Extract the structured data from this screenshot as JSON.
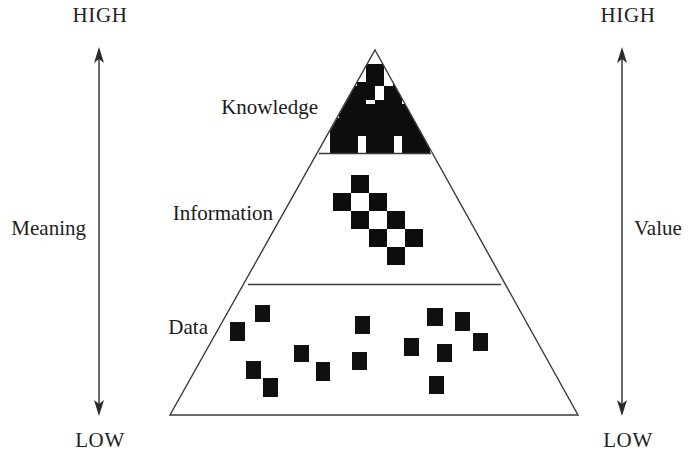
{
  "diagram": {
    "name": "dikw-pyramid",
    "background_color": "#ffffff",
    "ink_color": "#1a1a1a"
  },
  "left_axis": {
    "name": "Meaning",
    "top_cap": "HIGH",
    "bottom_cap": "LOW",
    "label": "Meaning",
    "direction": "double-headed-vertical",
    "x": 99,
    "top_y": 48,
    "bottom_y": 415
  },
  "right_axis": {
    "name": "Value",
    "top_cap": "HIGH",
    "bottom_cap": "LOW",
    "label": "Value",
    "direction": "double-headed-vertical",
    "x": 622,
    "top_y": 48,
    "bottom_y": 415
  },
  "pyramid": {
    "apex": {
      "x": 375,
      "y": 50
    },
    "base_left": {
      "x": 170,
      "y": 415
    },
    "base_right": {
      "x": 578,
      "y": 415
    },
    "tiers": [
      {
        "id": "knowledge",
        "label": "Knowledge",
        "label_x": 265,
        "label_y": 107,
        "fill_pattern": "dense-checkerboard",
        "divider_y": 153,
        "divider_x1": 322,
        "divider_x2": 430
      },
      {
        "id": "information",
        "label": "Information",
        "label_x": 205,
        "label_y": 213,
        "fill_pattern": "diagonal-checkerboard",
        "divider_y": 284,
        "divider_x1": 248,
        "divider_x2": 501
      },
      {
        "id": "data",
        "label": "Data",
        "label_x": 178,
        "label_y": 328,
        "fill_pattern": "scattered-squares",
        "divider_y": 415,
        "divider_x1": 170,
        "divider_x2": 578
      }
    ]
  },
  "chart_data": {
    "type": "diagram",
    "checker_cell": 18,
    "knowledge_checker_rows": [
      {
        "row": 0,
        "y": 50,
        "cells": []
      },
      {
        "row": 1,
        "y": 68,
        "cells": [
          {
            "x": 366,
            "dark": true
          }
        ]
      },
      {
        "row": 2,
        "y": 86,
        "cells": [
          {
            "x": 348,
            "dark": true
          },
          {
            "x": 366,
            "dark": false
          },
          {
            "x": 384,
            "dark": true
          }
        ]
      },
      {
        "row": 3,
        "y": 104,
        "cells": [
          {
            "x": 339,
            "dark": false
          },
          {
            "x": 357,
            "dark": true
          },
          {
            "x": 375,
            "dark": false
          },
          {
            "x": 393,
            "dark": true
          },
          {
            "x": 411,
            "dark": false
          }
        ]
      },
      {
        "row": 4,
        "y": 118,
        "cells": [
          {
            "x": 330,
            "dark": true
          },
          {
            "x": 348,
            "dark": false
          },
          {
            "x": 366,
            "dark": true
          },
          {
            "x": 384,
            "dark": false
          },
          {
            "x": 402,
            "dark": true
          },
          {
            "x": 420,
            "dark": false
          }
        ]
      },
      {
        "row": 5,
        "y": 136,
        "cells": [
          {
            "x": 322,
            "dark": false
          },
          {
            "x": 340,
            "dark": true
          },
          {
            "x": 358,
            "dark": false
          },
          {
            "x": 376,
            "dark": true
          },
          {
            "x": 394,
            "dark": false
          },
          {
            "x": 412,
            "dark": true
          }
        ]
      }
    ],
    "information_cells": [
      {
        "x": 351,
        "y": 175,
        "dark": true
      },
      {
        "x": 333,
        "y": 193,
        "dark": true
      },
      {
        "x": 351,
        "y": 193,
        "dark": false
      },
      {
        "x": 369,
        "y": 193,
        "dark": true
      },
      {
        "x": 351,
        "y": 211,
        "dark": true
      },
      {
        "x": 369,
        "y": 211,
        "dark": false
      },
      {
        "x": 387,
        "y": 211,
        "dark": true
      },
      {
        "x": 369,
        "y": 229,
        "dark": true
      },
      {
        "x": 387,
        "y": 229,
        "dark": false
      },
      {
        "x": 405,
        "y": 229,
        "dark": true
      },
      {
        "x": 387,
        "y": 247,
        "dark": true
      }
    ],
    "data_squares": [
      {
        "x": 255,
        "y": 305,
        "w": 15,
        "h": 17
      },
      {
        "x": 230,
        "y": 322,
        "w": 15,
        "h": 19
      },
      {
        "x": 294,
        "y": 345,
        "w": 15,
        "h": 17
      },
      {
        "x": 316,
        "y": 362,
        "w": 14,
        "h": 19
      },
      {
        "x": 246,
        "y": 361,
        "w": 15,
        "h": 18
      },
      {
        "x": 263,
        "y": 378,
        "w": 15,
        "h": 19
      },
      {
        "x": 355,
        "y": 316,
        "w": 15,
        "h": 18
      },
      {
        "x": 352,
        "y": 352,
        "w": 15,
        "h": 18
      },
      {
        "x": 404,
        "y": 338,
        "w": 15,
        "h": 18
      },
      {
        "x": 427,
        "y": 308,
        "w": 16,
        "h": 18
      },
      {
        "x": 429,
        "y": 376,
        "w": 15,
        "h": 18
      },
      {
        "x": 437,
        "y": 344,
        "w": 15,
        "h": 18
      },
      {
        "x": 455,
        "y": 312,
        "w": 15,
        "h": 19
      },
      {
        "x": 473,
        "y": 333,
        "w": 15,
        "h": 18
      }
    ]
  }
}
